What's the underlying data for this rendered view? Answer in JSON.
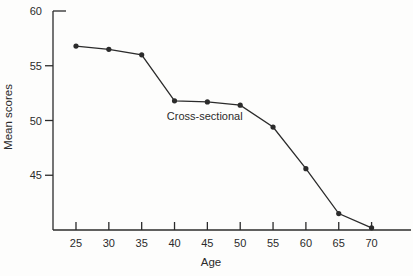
{
  "figure": {
    "background": "#fdfdfc",
    "ink_color": "#2b2b2b"
  },
  "chart_data": {
    "type": "line",
    "title": "",
    "xlabel": "Age",
    "ylabel": "Mean scores",
    "x": [
      25,
      30,
      35,
      40,
      45,
      50,
      55,
      60,
      65,
      70
    ],
    "series": [
      {
        "name": "Cross-sectional",
        "values": [
          56.8,
          56.5,
          56.0,
          51.8,
          51.7,
          51.4,
          49.4,
          45.6,
          41.5,
          40.2
        ]
      }
    ],
    "annotation": {
      "text": "Cross-sectional",
      "x": 44.6,
      "y": 50.4
    },
    "xlim": [
      21.5,
      76
    ],
    "ylim": [
      40,
      60
    ],
    "x_ticks": [
      25,
      30,
      35,
      40,
      45,
      50,
      55,
      60,
      65,
      70
    ],
    "y_ticks": [
      45,
      50,
      55,
      60
    ],
    "grid": false,
    "legend": "none",
    "marker": "filled-circle",
    "line_color": "#2b2b2b"
  }
}
